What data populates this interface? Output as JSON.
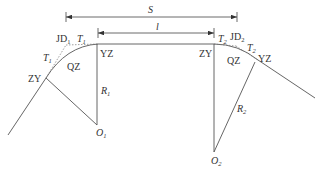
{
  "diagram": {
    "type": "road-horizontal-curve-layout",
    "colors": {
      "line": "#555555",
      "text": "#333333",
      "background": "#ffffff"
    },
    "dimensions": {
      "S": {
        "label": "S"
      },
      "l": {
        "label": "l"
      }
    },
    "curve1": {
      "labels": {
        "JD": "JD",
        "JD_sub": "1",
        "T_top": "T",
        "T_top_sub": "1",
        "T_left": "T",
        "T_left_sub": "1",
        "QZ": "QZ",
        "ZY": "ZY",
        "YZ": "YZ",
        "R": "R",
        "R_sub": "1",
        "O": "O",
        "O_sub": "1"
      }
    },
    "curve2": {
      "labels": {
        "JD": "JD",
        "JD_sub": "2",
        "T_top": "T",
        "T_top_sub": "2",
        "T_right": "T",
        "T_right_sub": "2",
        "QZ": "QZ",
        "ZY": "ZY",
        "YZ": "YZ",
        "R": "R",
        "R_sub": "2",
        "O": "O",
        "O_sub": "2"
      }
    }
  }
}
